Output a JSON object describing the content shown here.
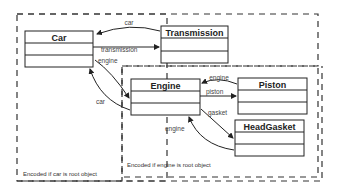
{
  "diagram": {
    "type": "object-graph",
    "regions": [
      {
        "id": "car-root",
        "caption": "Encoded if car is root object"
      },
      {
        "id": "engine-root",
        "caption": "Encoded if engine is root object"
      }
    ],
    "classes": [
      {
        "id": "car",
        "name": "Car"
      },
      {
        "id": "transmission",
        "name": "Transmission"
      },
      {
        "id": "engine",
        "name": "Engine"
      },
      {
        "id": "piston",
        "name": "Piston"
      },
      {
        "id": "headgasket",
        "name": "HeadGasket"
      }
    ],
    "edges": [
      {
        "from": "transmission",
        "to": "car",
        "label": "car"
      },
      {
        "from": "car",
        "to": "transmission",
        "label": "transmission"
      },
      {
        "from": "car",
        "to": "engine",
        "label": "engine"
      },
      {
        "from": "engine",
        "to": "car",
        "label": "car"
      },
      {
        "from": "piston",
        "to": "engine",
        "label": "engine"
      },
      {
        "from": "engine",
        "to": "piston",
        "label": "piston"
      },
      {
        "from": "engine",
        "to": "headgasket",
        "label": "gasket"
      },
      {
        "from": "headgasket",
        "to": "engine",
        "label": "engine"
      }
    ]
  }
}
